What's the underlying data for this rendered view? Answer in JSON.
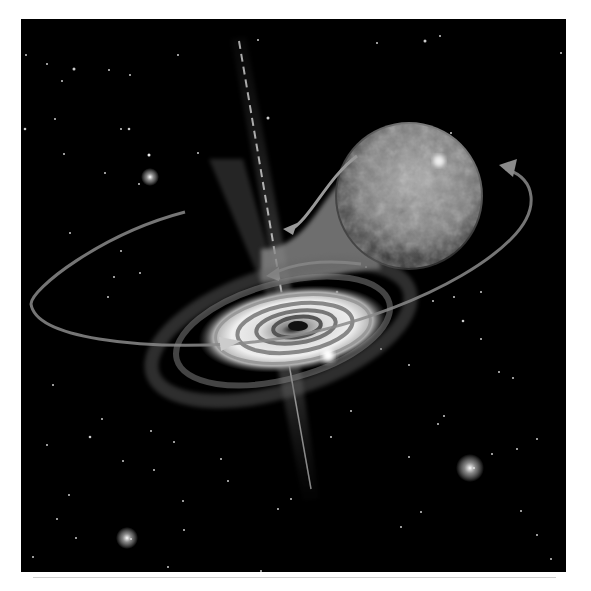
{
  "image": {
    "subject": "black hole accretion disk with companion star",
    "palette": "grayscale",
    "elements": [
      {
        "name": "star-field",
        "description": "scattered point stars on black sky"
      },
      {
        "name": "companion-star",
        "description": "large mottled sphere upper right, mass stream flowing toward disk"
      },
      {
        "name": "accretion-disk",
        "description": "spiral disk with dark center"
      },
      {
        "name": "polar-jets",
        "description": "narrow beams above and below disk"
      },
      {
        "name": "orbit-arrow",
        "description": "elliptical orbit path with arrowheads"
      }
    ]
  },
  "colors": {
    "background": "#000000",
    "page": "#ffffff",
    "rule": "#cfcfcf"
  }
}
